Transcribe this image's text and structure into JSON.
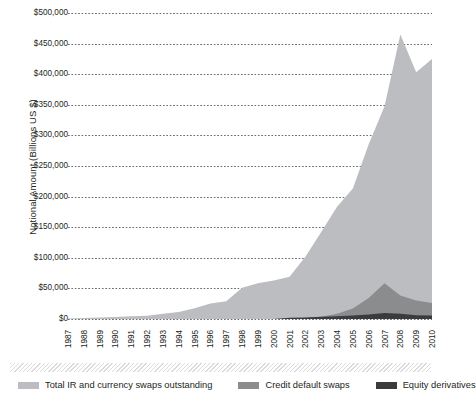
{
  "chart_data": {
    "type": "area",
    "stacked": false,
    "title": "",
    "xlabel": "",
    "ylabel": "Notional Amount (Billions US $)",
    "ylim": [
      0,
      500000
    ],
    "ytick_values": [
      0,
      50000,
      100000,
      150000,
      200000,
      250000,
      300000,
      350000,
      400000,
      450000,
      500000
    ],
    "ytick_labels": [
      "$0",
      "$50,000",
      "$100,000",
      "$150,000",
      "$200,000",
      "$250,000",
      "$300,000",
      "$350,000",
      "$400,000",
      "$450,000",
      "$500,000"
    ],
    "grid": true,
    "grid_style": "dotted-horizontal",
    "legend_position": "bottom",
    "categories": [
      "1987",
      "1988",
      "1989",
      "1990",
      "1991",
      "1992",
      "1993",
      "1994",
      "1995",
      "1996",
      "1997",
      "1998",
      "1999",
      "2000",
      "2001",
      "2002",
      "2003",
      "2004",
      "2005",
      "2006",
      "2007",
      "2008",
      "2009",
      "2010"
    ],
    "series": [
      {
        "name": "Total IR and currency swaps outstanding",
        "color": "#bcbdc0",
        "values": [
          900,
          1700,
          2500,
          3450,
          4450,
          5350,
          8470,
          11300,
          17710,
          25450,
          29035,
          50997,
          58265,
          63009,
          69207,
          101658,
          142307,
          183583,
          213194,
          285728,
          347508,
          464695,
          403074,
          425000
        ]
      },
      {
        "name": "Credit default swaps",
        "color": "#8b8c8e",
        "values": [
          0,
          0,
          0,
          0,
          0,
          0,
          0,
          0,
          0,
          0,
          0,
          0,
          0,
          0,
          919,
          2192,
          3779,
          8422,
          17096,
          34423,
          58244,
          38564,
          30428,
          26250
        ]
      },
      {
        "name": "Equity derivatives",
        "color": "#3b3b3d",
        "values": [
          0,
          0,
          0,
          0,
          0,
          0,
          0,
          0,
          0,
          0,
          0,
          0,
          0,
          0,
          1881,
          2309,
          3787,
          4385,
          5554,
          7488,
          9996,
          8733,
          6155,
          5635
        ]
      }
    ]
  },
  "legend": {
    "items": [
      {
        "label": "Total IR and currency swaps outstanding",
        "color": "#bcbdc0"
      },
      {
        "label": "Credit default swaps",
        "color": "#8b8c8e"
      },
      {
        "label": "Equity derivatives",
        "color": "#3b3b3d"
      }
    ]
  }
}
